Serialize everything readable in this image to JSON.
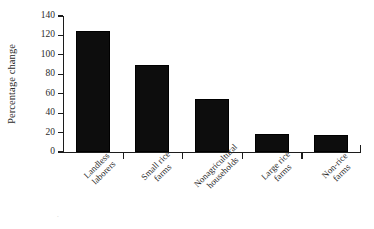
{
  "chart_data": {
    "type": "bar",
    "title": "",
    "subtitle": "",
    "xlabel": "",
    "ylabel": "Percentage change",
    "categories": [
      "Landless laborers",
      "Small rice farms",
      "Nonagricultural households",
      "Large rice farms",
      "Non-rice farms"
    ],
    "category_lines": [
      [
        "Landless",
        "laborers"
      ],
      [
        "Small rice",
        "farms"
      ],
      [
        "Nonagricultural",
        "households"
      ],
      [
        "Large rice",
        "farms"
      ],
      [
        "Non-rice",
        "farms"
      ]
    ],
    "values": [
      125,
      90,
      55,
      19,
      18
    ],
    "ylim": [
      0,
      140
    ],
    "ytick_values": [
      0,
      20,
      40,
      60,
      80,
      100,
      120,
      140
    ],
    "ytick_labels": [
      "0",
      "20",
      "40",
      "60",
      "80",
      "100",
      "120",
      "140"
    ],
    "grid": false,
    "legend": false,
    "legend_position": "none",
    "bar_color": "#0d0d0d",
    "axis_color": "#1c1c1c",
    "background_color": "#ffffff",
    "xlabel_rotation_deg": -45
  },
  "figure": {
    "axis_title_y": "Percentage change",
    "artifact_mark": "."
  }
}
